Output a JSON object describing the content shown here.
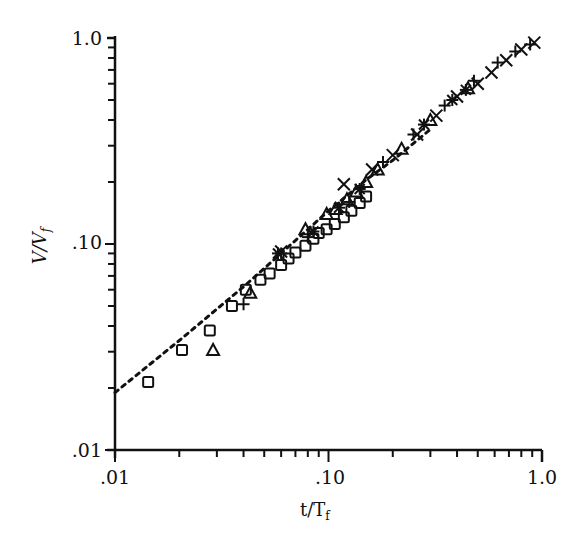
{
  "chart_data": {
    "type": "scatter",
    "title": "",
    "xlabel": "t/T_f",
    "ylabel": "V/V_f",
    "xscale": "log",
    "yscale": "log",
    "xlim": [
      0.01,
      1.0
    ],
    "ylim": [
      0.01,
      1.0
    ],
    "xticks": [
      ".01",
      ".10",
      "1.0"
    ],
    "yticks": [
      ".01",
      ".10",
      "1.0"
    ],
    "grid": false,
    "legend": null,
    "series": [
      {
        "name": "squares",
        "marker": "square",
        "x": [
          0.0143,
          0.0206,
          0.0278,
          0.0353,
          0.041,
          0.048,
          0.053,
          0.06,
          0.065,
          0.07,
          0.078,
          0.085,
          0.09,
          0.098,
          0.107,
          0.118,
          0.128,
          0.14,
          0.15
        ],
        "y": [
          0.0214,
          0.0306,
          0.038,
          0.05,
          0.06,
          0.067,
          0.072,
          0.079,
          0.085,
          0.091,
          0.098,
          0.106,
          0.113,
          0.118,
          0.125,
          0.135,
          0.145,
          0.158,
          0.17
        ]
      },
      {
        "name": "triangles",
        "marker": "triangle",
        "x": [
          0.0288,
          0.043,
          0.078,
          0.098,
          0.108,
          0.122,
          0.135,
          0.15,
          0.17,
          0.22,
          0.3,
          0.45
        ],
        "y": [
          0.0306,
          0.058,
          0.118,
          0.14,
          0.148,
          0.165,
          0.18,
          0.2,
          0.23,
          0.29,
          0.4,
          0.57
        ]
      },
      {
        "name": "plus",
        "marker": "plus",
        "x": [
          0.04,
          0.06,
          0.08,
          0.125,
          0.18,
          0.25,
          0.35,
          0.48,
          0.62,
          0.75,
          0.88
        ],
        "y": [
          0.051,
          0.09,
          0.108,
          0.16,
          0.25,
          0.34,
          0.47,
          0.62,
          0.76,
          0.86,
          0.93
        ]
      },
      {
        "name": "crosses",
        "marker": "x",
        "x": [
          0.06,
          0.118,
          0.16,
          0.2,
          0.26,
          0.32,
          0.4,
          0.5,
          0.58,
          0.68,
          0.8,
          0.92
        ],
        "y": [
          0.092,
          0.195,
          0.23,
          0.27,
          0.34,
          0.42,
          0.52,
          0.6,
          0.68,
          0.78,
          0.88,
          0.95
        ]
      },
      {
        "name": "stars",
        "marker": "star",
        "x": [
          0.058,
          0.085,
          0.112,
          0.14,
          0.28,
          0.38,
          0.44
        ],
        "y": [
          0.09,
          0.115,
          0.15,
          0.185,
          0.38,
          0.5,
          0.56
        ]
      },
      {
        "name": "dashed-reference",
        "marker": "none",
        "line": "dashed",
        "x": [
          0.01,
          0.02,
          0.04,
          0.06,
          0.1,
          0.15,
          0.2,
          0.3
        ],
        "y": [
          0.019,
          0.034,
          0.062,
          0.09,
          0.145,
          0.205,
          0.255,
          0.36
        ]
      }
    ]
  },
  "axes": {
    "x_label_main": "t/T",
    "x_label_sub": "f",
    "y_label_main": "V/V",
    "y_label_sub": "f",
    "x_tick_labels": [
      ".01",
      ".10",
      "1.0"
    ],
    "y_tick_labels": [
      ".01",
      ".10",
      "1.0"
    ]
  }
}
